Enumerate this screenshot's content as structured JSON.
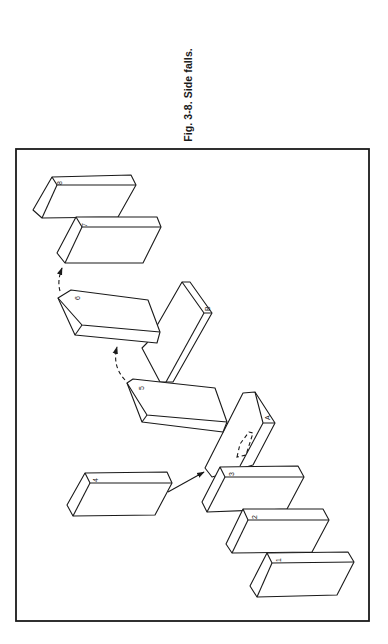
{
  "figure": {
    "caption": "Fig. 3-8. Side falls.",
    "frame": {
      "x": 16,
      "y": 149,
      "width": 353,
      "height": 472
    },
    "blocks": [
      {
        "id": "block-1",
        "label": "1"
      },
      {
        "id": "block-2",
        "label": "2"
      },
      {
        "id": "block-3",
        "label": "3"
      },
      {
        "id": "block-4",
        "label": "4"
      },
      {
        "id": "block-5",
        "label": "5"
      },
      {
        "id": "block-6",
        "label": "6"
      },
      {
        "id": "block-7",
        "label": "7"
      },
      {
        "id": "block-8",
        "label": "8"
      },
      {
        "id": "block-A",
        "label": "A"
      },
      {
        "id": "block-B",
        "label": "B"
      }
    ],
    "arrows": [
      {
        "id": "arrow-4-to-3",
        "style": "solid",
        "from": "4",
        "to": "3"
      },
      {
        "id": "arrow-5-to-6",
        "style": "dashed",
        "from": "5",
        "to": "6"
      },
      {
        "id": "arrow-6-to-7",
        "style": "dashed",
        "from": "6",
        "to": "7"
      }
    ],
    "colors": {
      "ink": "#1a1a1a",
      "paper": "#ffffff"
    }
  }
}
